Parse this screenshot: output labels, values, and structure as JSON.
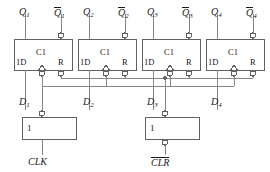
{
  "diagram": {
    "flipflops": [
      {
        "id": "ff1",
        "pin_d": "1D",
        "pin_clk": "C1",
        "pin_r": "R",
        "q": "Q",
        "q_sub": "1",
        "qbar": "Q",
        "qbar_sub": "1",
        "d_label": "D",
        "d_sub": "1"
      },
      {
        "id": "ff2",
        "pin_d": "1D",
        "pin_clk": "C1",
        "pin_r": "R",
        "q": "Q",
        "q_sub": "2",
        "qbar": "Q",
        "qbar_sub": "2",
        "d_label": "D",
        "d_sub": "2"
      },
      {
        "id": "ff3",
        "pin_d": "1D",
        "pin_clk": "C1",
        "pin_r": "R",
        "q": "Q",
        "q_sub": "3",
        "qbar": "Q",
        "qbar_sub": "3",
        "d_label": "D",
        "d_sub": "3"
      },
      {
        "id": "ff4",
        "pin_d": "1D",
        "pin_clk": "C1",
        "pin_r": "R",
        "q": "Q",
        "q_sub": "4",
        "qbar": "Q",
        "qbar_sub": "4",
        "d_label": "D",
        "d_sub": "4"
      }
    ],
    "buffers": [
      {
        "id": "clk-buffer",
        "symbol": "1",
        "signal": "CLK",
        "overbar": false
      },
      {
        "id": "clr-buffer",
        "symbol": "1",
        "signal": "CLR",
        "overbar": true
      }
    ],
    "colors": {
      "line": "#7a7d80",
      "box_border": "#5a5d60",
      "text": "#1a1a1a",
      "background": "#ffffff",
      "junction": "#5a5d60"
    }
  }
}
